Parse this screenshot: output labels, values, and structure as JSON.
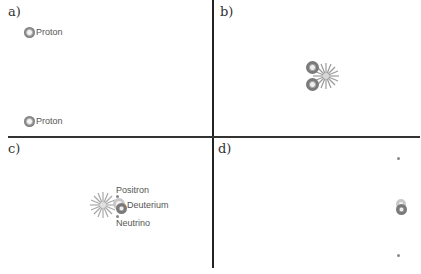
{
  "panels": {
    "a": {
      "label": "a)",
      "particles": [
        {
          "name": "proton-top",
          "label": "Proton"
        },
        {
          "name": "proton-bottom",
          "label": "Proton"
        }
      ]
    },
    "b": {
      "label": "b)",
      "description": "Two protons colliding with a burst of energy"
    },
    "c": {
      "label": "c)",
      "particles": [
        {
          "name": "positron",
          "label": "Positron"
        },
        {
          "name": "deuterium",
          "label": "Deuterium"
        },
        {
          "name": "neutrino",
          "label": "Neutrino"
        }
      ]
    },
    "d": {
      "label": "d)",
      "description": "Deuterium nucleus with positron and neutrino moving away"
    }
  },
  "colors": {
    "divider": "#222222",
    "particle_gray": "#7a7a7a",
    "text": "#555555"
  }
}
